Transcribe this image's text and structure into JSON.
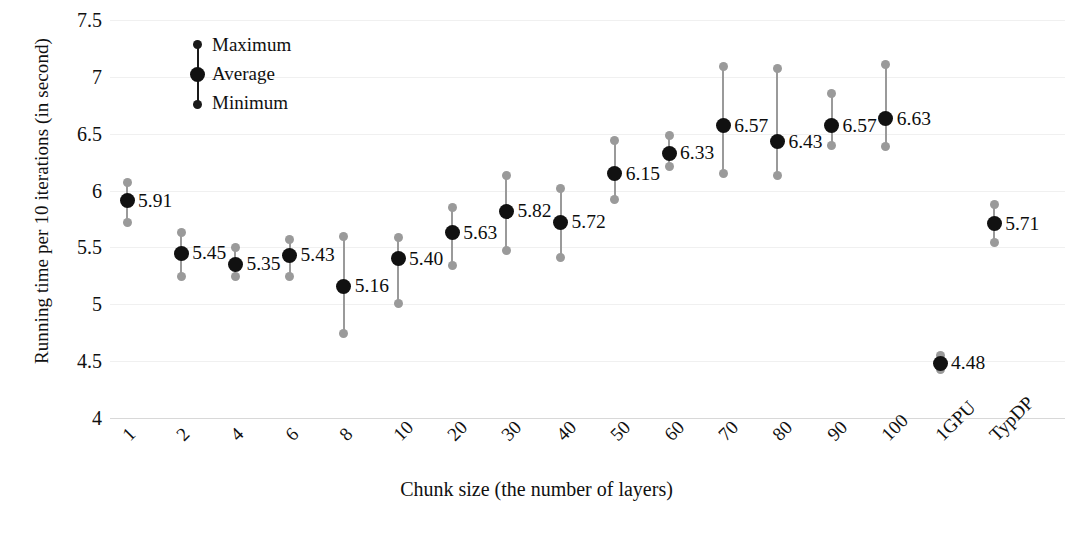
{
  "chart_data": {
    "type": "scatter",
    "title": "",
    "xlabel": "Chunk size (the number of layers)",
    "ylabel": "Running time per 10 iterations (in second)",
    "ylim": [
      4,
      7.5
    ],
    "yticks": [
      4,
      4.5,
      5,
      5.5,
      6,
      6.5,
      7,
      7.5
    ],
    "ytick_labels": [
      "4",
      "4.5",
      "5",
      "5.5",
      "6",
      "6.5",
      "7",
      "7.5"
    ],
    "grid": false,
    "legend_position": "upper-left-inside",
    "legend": [
      "Maximum",
      "Average",
      "Minimum"
    ],
    "categories": [
      "1",
      "2",
      "4",
      "6",
      "8",
      "10",
      "20",
      "30",
      "40",
      "50",
      "60",
      "70",
      "80",
      "90",
      "100",
      "1GPU",
      "TypDP"
    ],
    "series": [
      {
        "name": "Average",
        "values": [
          5.91,
          5.45,
          5.35,
          5.43,
          5.16,
          5.4,
          5.63,
          5.82,
          5.72,
          6.15,
          6.33,
          6.57,
          6.43,
          6.57,
          6.63,
          4.48,
          5.71
        ]
      },
      {
        "name": "Maximum",
        "values": [
          6.07,
          5.63,
          5.5,
          5.57,
          5.6,
          5.59,
          5.85,
          6.13,
          6.02,
          6.44,
          6.48,
          7.09,
          7.07,
          6.85,
          7.11,
          4.55,
          5.88
        ]
      },
      {
        "name": "Minimum",
        "values": [
          5.72,
          5.24,
          5.24,
          5.24,
          4.74,
          5.01,
          5.34,
          5.47,
          5.41,
          5.92,
          6.21,
          6.15,
          6.13,
          6.4,
          6.39,
          4.43,
          5.54
        ]
      }
    ],
    "point_labels": [
      "5.91",
      "5.45",
      "5.35",
      "5.43",
      "5.16",
      "5.40",
      "5.63",
      "5.82",
      "5.72",
      "6.15",
      "6.33",
      "6.57",
      "6.43",
      "6.57",
      "6.63",
      "4.48",
      "5.71"
    ],
    "colors": {
      "average_marker": "#111111",
      "extreme_marker": "#9a9a9a",
      "whisker": "#9a9a9a",
      "axis": "#d8d8d8",
      "text": "#101010",
      "background": "#ffffff"
    }
  }
}
